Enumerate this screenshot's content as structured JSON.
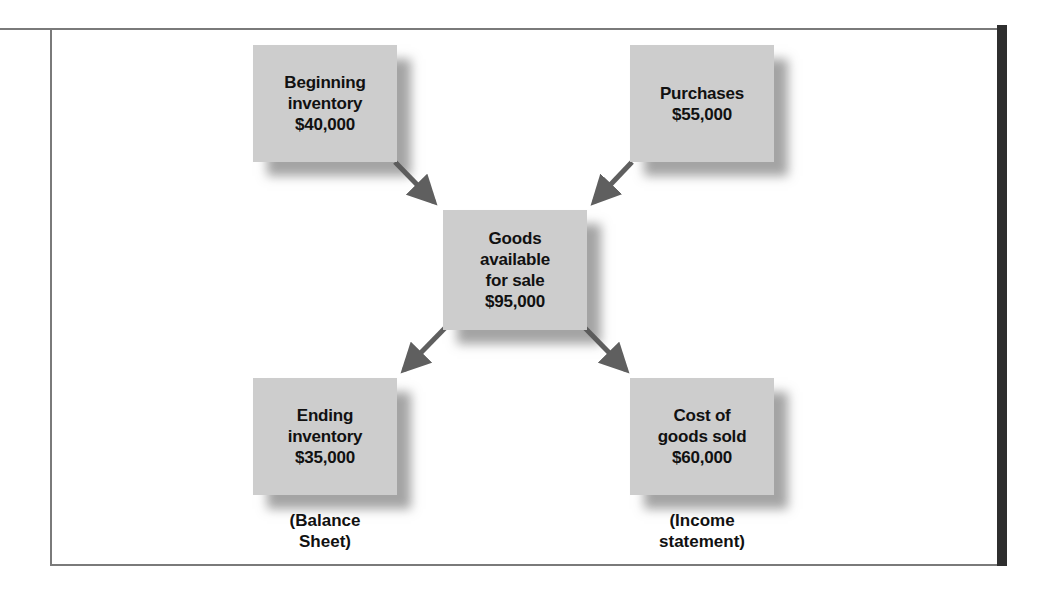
{
  "diagram": {
    "type": "flow",
    "nodes": [
      {
        "id": "beginning_inventory",
        "lines": [
          "Beginning",
          "inventory",
          "$40,000"
        ],
        "label": "Beginning inventory",
        "value": "$40,000"
      },
      {
        "id": "purchases",
        "lines": [
          "Purchases",
          "$55,000"
        ],
        "label": "Purchases",
        "value": "$55,000"
      },
      {
        "id": "goods_available",
        "lines": [
          "Goods",
          "available",
          "for sale",
          "$95,000"
        ],
        "label": "Goods available for sale",
        "value": "$95,000"
      },
      {
        "id": "ending_inventory",
        "lines": [
          "Ending",
          "inventory",
          "$35,000"
        ],
        "label": "Ending inventory",
        "value": "$35,000"
      },
      {
        "id": "cogs",
        "lines": [
          "Cost of",
          "goods sold",
          "$60,000"
        ],
        "label": "Cost of goods sold",
        "value": "$60,000"
      }
    ],
    "edges": [
      {
        "from": "beginning_inventory",
        "to": "goods_available"
      },
      {
        "from": "purchases",
        "to": "goods_available"
      },
      {
        "from": "goods_available",
        "to": "ending_inventory"
      },
      {
        "from": "goods_available",
        "to": "cogs"
      }
    ],
    "captions": {
      "balance_sheet": [
        "(Balance",
        "Sheet)"
      ],
      "income_statement": [
        "(Income",
        "statement)"
      ]
    },
    "colors": {
      "box_fill": "#cdcdcd",
      "arrow": "#5f5f5f",
      "frame": "#7a7a7a",
      "frame_right": "#2e2e2e"
    }
  }
}
